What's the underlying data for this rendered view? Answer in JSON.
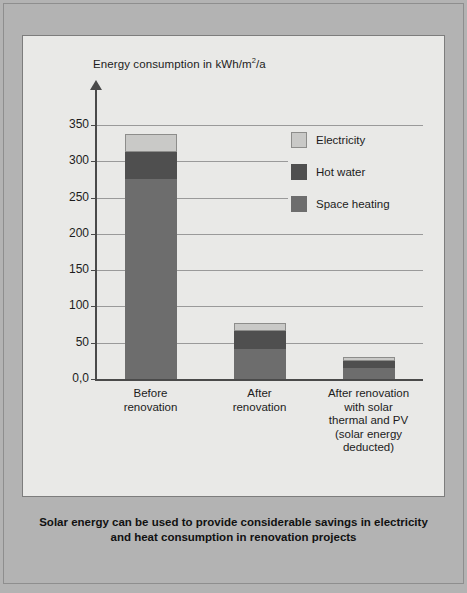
{
  "figure": {
    "caption": "Solar energy can be used to provide considerable savings in electricity and heat consumption in renovation projects"
  },
  "colors": {
    "mat": "#b3b3b3",
    "panel": "#e9e9e7",
    "electricity": "#c9c9c7",
    "hot_water": "#4f4f4f",
    "space_heating": "#6d6d6d",
    "axis": "#4a4a4a",
    "grid": "#9a9a9a"
  },
  "chart_data": {
    "type": "bar",
    "stacked": true,
    "title": "",
    "axis_title": "Energy consumption in kWh/m²/a",
    "ylabel": "Energy consumption in kWh/m²/a",
    "xlabel": "",
    "ylim": [
      0,
      350
    ],
    "yticks": [
      0,
      50,
      100,
      150,
      200,
      250,
      300,
      350
    ],
    "ytick_labels": [
      "0,0",
      "50",
      "100",
      "150",
      "200",
      "250",
      "300",
      "350"
    ],
    "grid": true,
    "legend_position": "inside-upper-right",
    "categories": [
      "Before renovation",
      "After renovation",
      "After renovation with solar thermal and PV (solar energy deducted)"
    ],
    "category_labels": [
      [
        "Before",
        "renovation"
      ],
      [
        "After",
        "renovation"
      ],
      [
        "After renovation",
        "with solar",
        "thermal and PV",
        "(solar energy",
        "deducted)"
      ]
    ],
    "series": [
      {
        "name": "Space heating",
        "color": "#6d6d6d",
        "values": [
          276,
          41,
          15
        ]
      },
      {
        "name": "Hot water",
        "color": "#4f4f4f",
        "values": [
          37,
          25,
          10
        ]
      },
      {
        "name": "Electricity",
        "color": "#c9c9c7",
        "values": [
          25,
          11,
          5
        ]
      }
    ],
    "totals": [
      338,
      77,
      30
    ]
  },
  "legend": {
    "items": [
      {
        "label": "Electricity",
        "color": "#c9c9c7"
      },
      {
        "label": "Hot water",
        "color": "#4f4f4f"
      },
      {
        "label": "Space heating",
        "color": "#6d6d6d"
      }
    ]
  }
}
